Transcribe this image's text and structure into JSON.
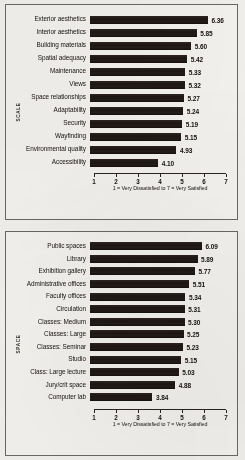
{
  "page": {
    "background_color": "#f2f1ed",
    "panel_border_color": "#6b6762",
    "bar_color": "#241c19",
    "text_color": "#17110f"
  },
  "charts": [
    {
      "id": "scale-satisfaction-chart",
      "axis_title": "SCALE",
      "xlabel": "1 = Very Dissatisfied to 7 = Very Satisfied",
      "chart_data": {
        "type": "bar",
        "orientation": "horizontal",
        "title": "",
        "xlabel": "1 = Very Dissatisfied to 7 = Very Satisfied",
        "ylabel": "SCALE",
        "xlim": [
          1,
          7
        ],
        "xticks": [
          1,
          2,
          3,
          4,
          5,
          6,
          7
        ],
        "grid": false,
        "legend": "none",
        "categories": [
          "Exterior aesthetics",
          "Interior aesthetics",
          "Building materials",
          "Spatial adequacy",
          "Maintenance",
          "Views",
          "Space relationships",
          "Adaptability",
          "Security",
          "Wayfinding",
          "Environmental quality",
          "Accessibility"
        ],
        "values": [
          6.36,
          5.85,
          5.6,
          5.42,
          5.33,
          5.32,
          5.27,
          5.24,
          5.19,
          5.15,
          4.93,
          4.1
        ],
        "value_labels": [
          "6.36",
          "5.85",
          "5.60",
          "5.42",
          "5.33",
          "5.32",
          "5.27",
          "5.24",
          "5.19",
          "5.15",
          "4.93",
          "4.10"
        ]
      }
    },
    {
      "id": "space-satisfaction-chart",
      "axis_title": "SPACE",
      "xlabel": "1 = Very Dissatisfied to 7 = Very Satisfied",
      "chart_data": {
        "type": "bar",
        "orientation": "horizontal",
        "title": "",
        "xlabel": "1 = Very Dissatisfied to 7 = Very Satisfied",
        "ylabel": "SPACE",
        "xlim": [
          1,
          7
        ],
        "xticks": [
          1,
          2,
          3,
          4,
          5,
          6,
          7
        ],
        "grid": false,
        "legend": "none",
        "categories": [
          "Public spaces",
          "Library",
          "Exhibition gallery",
          "Administrative offices",
          "Faculty offices",
          "Circulation",
          "Classes: Medium",
          "Classes: Large",
          "Classes: Seminar",
          "Studio",
          "Class: Large lecture",
          "Jury/crit space",
          "Computer lab"
        ],
        "values": [
          6.09,
          5.89,
          5.77,
          5.51,
          5.34,
          5.31,
          5.3,
          5.25,
          5.23,
          5.15,
          5.03,
          4.88,
          3.84
        ],
        "value_labels": [
          "6.09",
          "5.89",
          "5.77",
          "5.51",
          "5.34",
          "5.31",
          "5.30",
          "5.25",
          "5.23",
          "5.15",
          "5.03",
          "4.88",
          "3.84"
        ]
      }
    }
  ]
}
